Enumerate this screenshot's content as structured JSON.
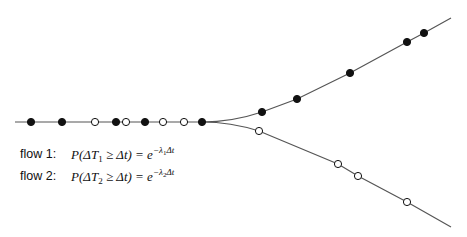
{
  "diagram": {
    "line_color": "#555555",
    "dot_fill_color": "#111111",
    "dot_open_color": "#ffffff",
    "merged_line": {
      "start": [
        15,
        122
      ],
      "end": [
        202,
        122
      ],
      "dots": [
        {
          "x": 31,
          "type": "filled"
        },
        {
          "x": 62,
          "type": "filled"
        },
        {
          "x": 95,
          "type": "open"
        },
        {
          "x": 116,
          "type": "filled"
        },
        {
          "x": 126,
          "type": "open"
        },
        {
          "x": 145,
          "type": "filled"
        },
        {
          "x": 163,
          "type": "open"
        },
        {
          "x": 184,
          "type": "open"
        },
        {
          "x": 202,
          "type": "filled"
        }
      ]
    },
    "flow1_branch": {
      "dots": [
        [
          262,
          112
        ],
        [
          297,
          99
        ],
        [
          350,
          73
        ],
        [
          407,
          42
        ],
        [
          424,
          33
        ]
      ],
      "end": [
        451,
        18
      ]
    },
    "flow2_branch": {
      "dots": [
        [
          259,
          131
        ],
        [
          338,
          164
        ],
        [
          358,
          176
        ],
        [
          407,
          202
        ]
      ],
      "end": [
        451,
        227
      ]
    }
  },
  "legend": {
    "flow1": {
      "label": "flow 1:",
      "formula_prefix": "P(ΔT",
      "subscript": "1",
      "formula_mid": " ≥ Δt) = e",
      "exponent": "−λ",
      "exponent_sub": "1",
      "exponent_tail": "Δt"
    },
    "flow2": {
      "label": "flow 2:",
      "formula_prefix": "P(ΔT",
      "subscript": "2",
      "formula_mid": " ≥ Δt) = e",
      "exponent": "−λ",
      "exponent_sub": "2",
      "exponent_tail": "Δt"
    }
  }
}
